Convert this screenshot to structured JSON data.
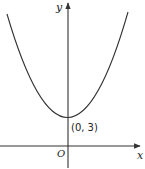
{
  "diagram": {
    "type": "function-graph",
    "axes": {
      "x_label": "x",
      "y_label": "y",
      "origin_label": "O"
    },
    "curve": {
      "shape": "parabola",
      "opens": "up",
      "vertex": [
        0,
        3
      ]
    },
    "annotations": [
      {
        "text": "(0, 3)",
        "point": [
          0,
          3
        ]
      }
    ],
    "colors": {
      "stroke": "#333333",
      "background": "#ffffff"
    }
  }
}
